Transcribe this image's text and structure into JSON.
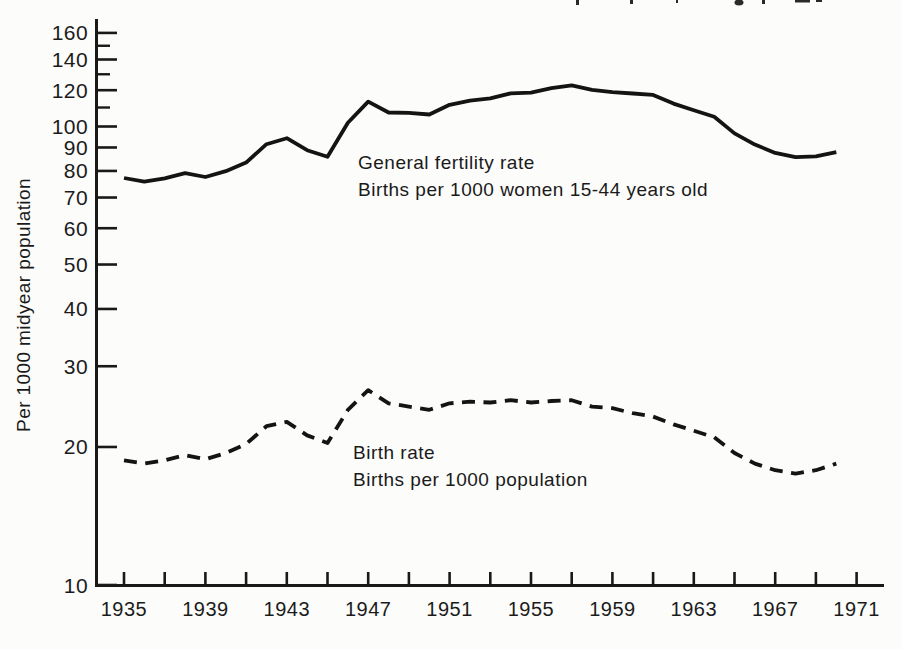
{
  "meta": {
    "background": "#fcfcfa",
    "ink": "#1a1a1a",
    "note": "scanned statistics-book chart, caption cropped at top edge"
  },
  "y_axis": {
    "title": "Per 1000 midyear population",
    "scale": "log",
    "major_ticks": [
      160,
      140,
      120,
      100,
      90,
      80,
      70,
      60,
      50,
      40,
      30,
      20,
      10
    ],
    "minor_ticks": [
      150,
      130,
      110
    ]
  },
  "x_axis": {
    "labels": [
      "1935",
      "1939",
      "1943",
      "1947",
      "1951",
      "1955",
      "1959",
      "1963",
      "1967",
      "1971"
    ],
    "tick_first_year": 1935,
    "tick_last_year": 1971,
    "tick_step_years": 2
  },
  "annotations": {
    "fertility": {
      "line1": "General fertility rate",
      "line2": "Births per 1000 women 15-44 years old"
    },
    "birth": {
      "line1": "Birth rate",
      "line2": "Births per 1000 population"
    }
  },
  "chart_data": {
    "type": "line",
    "title": "",
    "xlabel": "",
    "ylabel": "Per 1000 midyear population",
    "y_scale": "log",
    "ylim": [
      10,
      170
    ],
    "xlim": [
      1933.6,
      1972.3
    ],
    "grid": false,
    "x": [
      1935,
      1936,
      1937,
      1938,
      1939,
      1940,
      1941,
      1942,
      1943,
      1944,
      1945,
      1946,
      1947,
      1948,
      1949,
      1950,
      1951,
      1952,
      1953,
      1954,
      1955,
      1956,
      1957,
      1958,
      1959,
      1960,
      1961,
      1962,
      1963,
      1964,
      1965,
      1966,
      1967,
      1968,
      1969,
      1970
    ],
    "series": [
      {
        "name": "General fertility rate (births per 1000 women 15-44 years old)",
        "line_style": "solid",
        "values": [
          77.2,
          75.8,
          77.1,
          79.1,
          77.6,
          79.9,
          83.4,
          91.5,
          94.3,
          88.8,
          85.9,
          101.9,
          113.3,
          107.3,
          107.1,
          106.2,
          111.5,
          113.9,
          115.2,
          118.1,
          118.5,
          121.2,
          122.9,
          120.2,
          118.8,
          118.0,
          117.2,
          112.2,
          108.5,
          105.0,
          96.6,
          91.3,
          87.6,
          85.7,
          86.1,
          87.9
        ]
      },
      {
        "name": "Birth rate (births per 1000 population)",
        "line_style": "dashed",
        "values": [
          18.7,
          18.4,
          18.7,
          19.2,
          18.8,
          19.4,
          20.3,
          22.2,
          22.7,
          21.2,
          20.4,
          24.1,
          26.6,
          24.9,
          24.5,
          24.1,
          24.9,
          25.1,
          25.0,
          25.3,
          25.0,
          25.2,
          25.3,
          24.5,
          24.3,
          23.7,
          23.3,
          22.4,
          21.7,
          21.0,
          19.4,
          18.4,
          17.8,
          17.5,
          17.8,
          18.4
        ]
      }
    ]
  }
}
